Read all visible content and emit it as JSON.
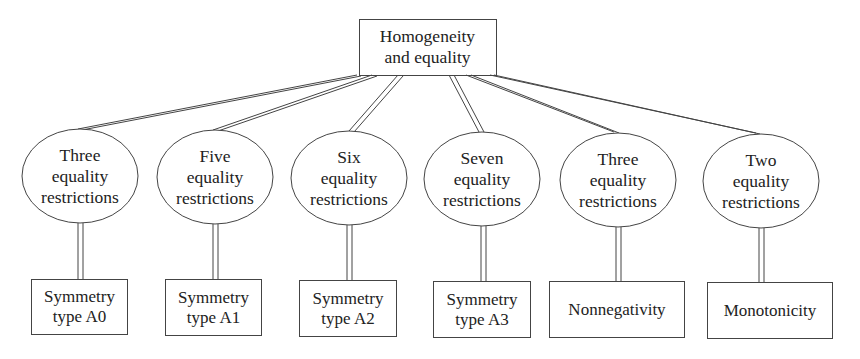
{
  "diagram": {
    "root": {
      "lines": [
        "Homogeneity",
        "and equality"
      ]
    },
    "middle": [
      {
        "lines": [
          "Three",
          "equality",
          "restrictions"
        ]
      },
      {
        "lines": [
          "Five",
          "equality",
          "restrictions"
        ]
      },
      {
        "lines": [
          "Six",
          "equality",
          "restrictions"
        ]
      },
      {
        "lines": [
          "Seven",
          "equality",
          "restrictions"
        ]
      },
      {
        "lines": [
          "Three",
          "equality",
          "restrictions"
        ]
      },
      {
        "lines": [
          "Two",
          "equality",
          "restrictions"
        ]
      }
    ],
    "leaves": [
      {
        "lines": [
          "Symmetry",
          "type A0"
        ]
      },
      {
        "lines": [
          "Symmetry",
          "type A1"
        ]
      },
      {
        "lines": [
          "Symmetry",
          "type A2"
        ]
      },
      {
        "lines": [
          "Symmetry",
          "type A3"
        ]
      },
      {
        "lines": [
          "Nonnegativity"
        ]
      },
      {
        "lines": [
          "Monotonicity"
        ]
      }
    ],
    "colors": {
      "stroke": "#444444",
      "text": "#222222",
      "background": "#ffffff"
    }
  }
}
